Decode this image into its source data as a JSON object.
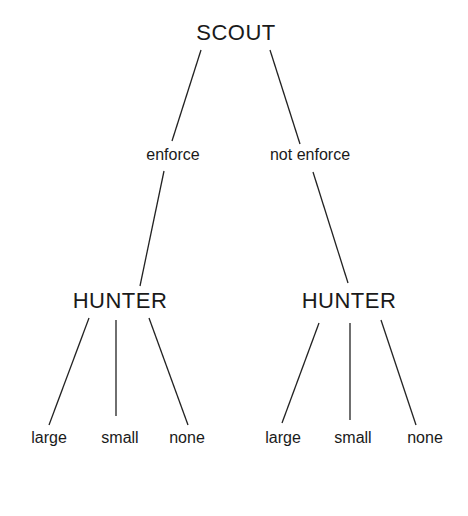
{
  "tree": {
    "root": {
      "label": "SCOUT",
      "x": 236,
      "y": 22
    },
    "branches": [
      {
        "action_label": "enforce",
        "action_x": 173,
        "action_y": 147,
        "node": {
          "label": "HUNTER",
          "x": 120,
          "y": 290
        },
        "leaves": [
          {
            "label": "large",
            "x": 49,
            "y": 430
          },
          {
            "label": "small",
            "x": 120,
            "y": 430
          },
          {
            "label": "none",
            "x": 187,
            "y": 430
          }
        ]
      },
      {
        "action_label": "not enforce",
        "action_x": 310,
        "action_y": 147,
        "node": {
          "label": "HUNTER",
          "x": 349,
          "y": 290
        },
        "leaves": [
          {
            "label": "large",
            "x": 283,
            "y": 430
          },
          {
            "label": "small",
            "x": 353,
            "y": 430
          },
          {
            "label": "none",
            "x": 425,
            "y": 430
          }
        ]
      }
    ],
    "edges": [
      [
        201,
        50,
        172,
        141
      ],
      [
        270,
        50,
        300,
        144
      ],
      [
        164,
        171,
        140,
        286
      ],
      [
        313,
        172,
        348,
        283
      ],
      [
        89,
        318,
        49,
        425
      ],
      [
        116,
        320,
        116,
        416
      ],
      [
        149,
        318,
        188,
        425
      ],
      [
        319,
        323,
        282,
        423
      ],
      [
        350,
        323,
        350,
        420
      ],
      [
        381,
        320,
        416,
        425
      ]
    ],
    "line_color": "#222222"
  }
}
